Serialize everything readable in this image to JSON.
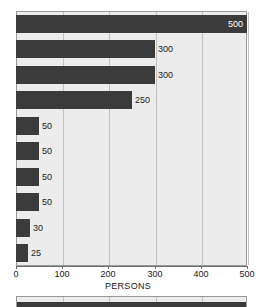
{
  "chart_data": {
    "type": "bar",
    "orientation": "horizontal",
    "title": "",
    "xlabel": "PERSONS",
    "ylabel": "",
    "xlim": [
      0,
      500
    ],
    "xticks": [
      0,
      100,
      200,
      300,
      400,
      500
    ],
    "xtick_labels": [
      "0",
      "100",
      "200",
      "300",
      "400",
      "500"
    ],
    "grid": true,
    "legend": false,
    "categories": [
      "",
      "",
      "",
      "",
      "",
      "",
      "",
      "",
      "",
      ""
    ],
    "values": [
      500,
      300,
      300,
      250,
      50,
      50,
      50,
      50,
      30,
      25
    ],
    "data_labels": [
      "500",
      "300",
      "300",
      "250",
      "50",
      "50",
      "50",
      "50",
      "30",
      "25"
    ],
    "label_placement": [
      "inside",
      "outside",
      "outside",
      "outside",
      "outside",
      "outside",
      "outside",
      "outside",
      "outside",
      "outside"
    ],
    "colors": {
      "bar": "#3b3b3b",
      "plot_background": "#ececec",
      "gridline": "#c2c2c2",
      "axis": "#6d6d6d",
      "text": "#1a1a1a",
      "inside_label_text": "#ffffff",
      "page_background": "#ffffff"
    }
  },
  "secondary_chart": {
    "type": "bar",
    "orientation": "horizontal",
    "note": "cropped at bottom edge",
    "values": [
      500
    ],
    "xlim": [
      0,
      500
    ],
    "xticks": [
      0,
      100,
      200,
      300,
      400,
      500
    ]
  }
}
